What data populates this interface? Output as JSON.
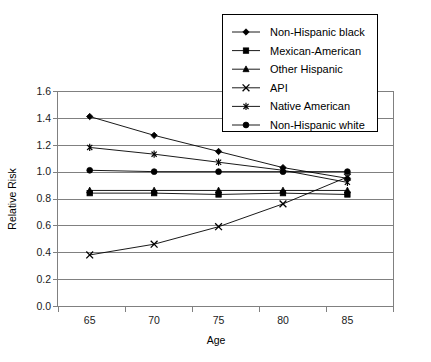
{
  "chart_data": {
    "type": "line",
    "title": "",
    "xlabel": "Age",
    "ylabel": "Relative Risk",
    "x": [
      65,
      70,
      75,
      80,
      85
    ],
    "xticks": [
      "65",
      "70",
      "75",
      "80",
      "85"
    ],
    "xlim": [
      62.5,
      88.5
    ],
    "ylim": [
      0.0,
      1.6
    ],
    "yticks": [
      "0.0",
      "0.2",
      "0.4",
      "0.6",
      "0.8",
      "1.0",
      "1.2",
      "1.4",
      "1.6"
    ],
    "ytick_values": [
      0.0,
      0.2,
      0.4,
      0.6,
      0.8,
      1.0,
      1.2,
      1.4,
      1.6
    ],
    "grid": true,
    "legend_position": "top-right",
    "series": [
      {
        "name": "Non-Hispanic black",
        "marker": "diamond",
        "values": [
          1.41,
          1.27,
          1.15,
          1.03,
          0.95
        ]
      },
      {
        "name": "Mexican-American",
        "marker": "square",
        "values": [
          0.84,
          0.84,
          0.83,
          0.84,
          0.83
        ]
      },
      {
        "name": "Other Hispanic",
        "marker": "triangle",
        "values": [
          0.86,
          0.86,
          0.86,
          0.86,
          0.86
        ]
      },
      {
        "name": "API",
        "marker": "x",
        "values": [
          0.38,
          0.46,
          0.59,
          0.76,
          0.96
        ]
      },
      {
        "name": "Native American",
        "marker": "star",
        "values": [
          1.18,
          1.13,
          1.07,
          1.01,
          0.92
        ]
      },
      {
        "name": "Non-Hispanic white",
        "marker": "circle",
        "values": [
          1.01,
          1.0,
          1.0,
          1.0,
          1.0
        ]
      }
    ]
  },
  "axes": {
    "x_title": "Age",
    "y_title": "Relative Risk"
  },
  "legend": {
    "items": [
      {
        "label": "Non-Hispanic black",
        "marker": "diamond"
      },
      {
        "label": "Mexican-American",
        "marker": "square"
      },
      {
        "label": "Other Hispanic",
        "marker": "triangle"
      },
      {
        "label": "API",
        "marker": "x"
      },
      {
        "label": "Native American",
        "marker": "star"
      },
      {
        "label": "Non-Hispanic white",
        "marker": "circle"
      }
    ]
  },
  "colors": {
    "series": "#000000",
    "grid": "#808080",
    "background": "#ffffff"
  }
}
